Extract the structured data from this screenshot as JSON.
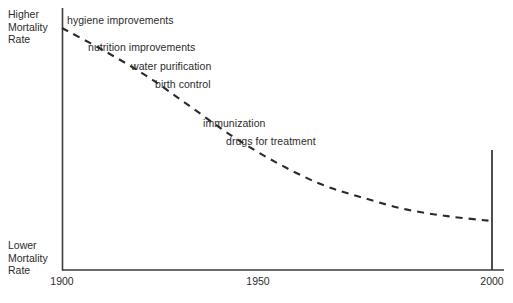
{
  "chart_data": {
    "type": "line",
    "title": "",
    "subtitle": "",
    "xlabel": "",
    "ylabel": "",
    "xlim": [
      1900,
      2000
    ],
    "ylim": [
      0,
      100
    ],
    "grid": false,
    "legend": "none",
    "line_style": "dashed",
    "line_color": "#2b2b2b",
    "axis_color": "#3a3a3a",
    "background_color": "#ffffff",
    "y_axis_top_label": "Higher Mortality Rate",
    "y_axis_bottom_label": "Lower Mortality Rate",
    "xticks": [
      1900,
      1950,
      2000
    ],
    "xticklabels": [
      "1900",
      "1950",
      "2000"
    ],
    "yticks": [],
    "yticklabels": [],
    "series": [
      {
        "name": "mortality rate",
        "x": [
          1900,
          1910,
          1920,
          1930,
          1940,
          1950,
          1960,
          1970,
          1980,
          1990,
          2000
        ],
        "y": [
          100,
          90,
          79,
          66,
          53,
          42,
          33,
          27,
          22,
          19,
          17
        ]
      }
    ],
    "annotations": [
      {
        "text": "hygiene improvements",
        "x": 1903,
        "y": 96
      },
      {
        "text": "nutrition improvements",
        "x": 1909,
        "y": 85
      },
      {
        "text": "water purification",
        "x": 1916,
        "y": 77
      },
      {
        "text": "birth control",
        "x": 1922,
        "y": 69
      },
      {
        "text": "immunization",
        "x": 1933,
        "y": 51
      },
      {
        "text": "drugs for treatment",
        "x": 1938,
        "y": 43
      }
    ]
  },
  "axis_labels": {
    "top": {
      "line1": "Higher",
      "line2": "Mortality",
      "line3": "Rate"
    },
    "bottom": {
      "line1": "Lower",
      "line2": "Mortality",
      "line3": "Rate"
    }
  },
  "ticks": [
    {
      "label": "1900"
    },
    {
      "label": "1950"
    },
    {
      "label": "2000"
    }
  ],
  "annotations": [
    {
      "label": "hygiene improvements"
    },
    {
      "label": "nutrition improvements"
    },
    {
      "label": "water purification"
    },
    {
      "label": "birth control"
    },
    {
      "label": "immunization"
    },
    {
      "label": "drugs for treatment"
    }
  ]
}
